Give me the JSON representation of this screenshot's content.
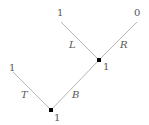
{
  "diagram": {
    "type": "binary-tree",
    "nodes": [
      {
        "id": "root",
        "value": "1",
        "internal": true
      },
      {
        "id": "mid",
        "value": "1",
        "internal": true
      },
      {
        "id": "leaf-t",
        "value": "1"
      },
      {
        "id": "leaf-l",
        "value": "1"
      },
      {
        "id": "leaf-r",
        "value": "0"
      }
    ],
    "edges": [
      {
        "from": "root",
        "to": "leaf-t",
        "label": "T"
      },
      {
        "from": "root",
        "to": "mid",
        "label": "B"
      },
      {
        "from": "mid",
        "to": "leaf-l",
        "label": "L"
      },
      {
        "from": "mid",
        "to": "leaf-r",
        "label": "R"
      }
    ]
  }
}
